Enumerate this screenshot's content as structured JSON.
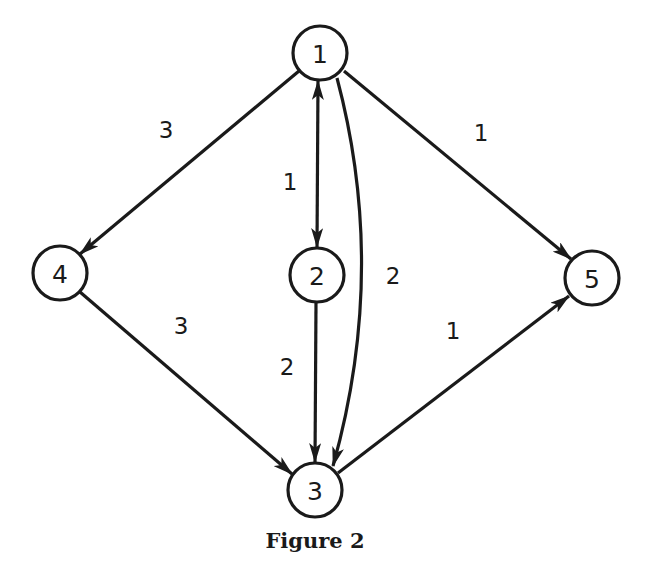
{
  "figure": {
    "caption": "Figure 2",
    "colors": {
      "stroke": "#1a1a1a",
      "background": "#ffffff"
    }
  },
  "nodes": [
    {
      "id": "1",
      "label": "1",
      "x": 320,
      "y": 53
    },
    {
      "id": "2",
      "label": "2",
      "x": 317,
      "y": 275
    },
    {
      "id": "3",
      "label": "3",
      "x": 315,
      "y": 490
    },
    {
      "id": "4",
      "label": "4",
      "x": 60,
      "y": 273
    },
    {
      "id": "5",
      "label": "5",
      "x": 592,
      "y": 278
    }
  ],
  "edges": [
    {
      "from": "1",
      "to": "4",
      "weight": "3",
      "direction": "directed"
    },
    {
      "from": "1",
      "to": "2",
      "weight": "1",
      "direction": "bidirectional"
    },
    {
      "from": "1",
      "to": "3",
      "weight": "2",
      "direction": "directed",
      "shape": "curved"
    },
    {
      "from": "1",
      "to": "5",
      "weight": "1",
      "direction": "directed"
    },
    {
      "from": "2",
      "to": "3",
      "weight": "2",
      "direction": "directed"
    },
    {
      "from": "4",
      "to": "3",
      "weight": "3",
      "direction": "directed"
    },
    {
      "from": "3",
      "to": "5",
      "weight": "1",
      "direction": "directed"
    }
  ]
}
